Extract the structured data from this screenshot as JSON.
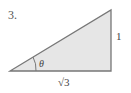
{
  "problem": {
    "number": "3."
  },
  "triangle": {
    "fill_color": "#e6e6e6",
    "stroke_color": "#777777",
    "vertices": {
      "left": [
        10,
        71
      ],
      "right": [
        111,
        71
      ],
      "top": [
        111,
        10
      ]
    },
    "angle_label": "θ",
    "opposite_side_label": "1",
    "adjacent_side_label": "√3"
  }
}
